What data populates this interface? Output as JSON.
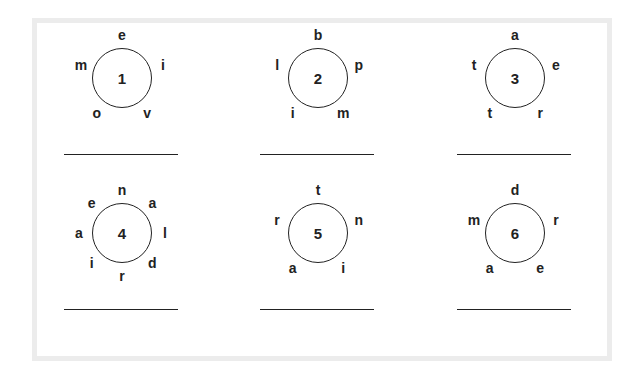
{
  "worksheet": {
    "puzzles": [
      {
        "number": "1",
        "letters": [
          "e",
          "i",
          "v",
          "o",
          "m"
        ]
      },
      {
        "number": "2",
        "letters": [
          "b",
          "p",
          "m",
          "i",
          "l"
        ]
      },
      {
        "number": "3",
        "letters": [
          "a",
          "e",
          "r",
          "t",
          "t"
        ]
      },
      {
        "number": "4",
        "letters": [
          "n",
          "a",
          "l",
          "d",
          "r",
          "i",
          "a",
          "e"
        ]
      },
      {
        "number": "5",
        "letters": [
          "t",
          "n",
          "i",
          "a",
          "r"
        ]
      },
      {
        "number": "6",
        "letters": [
          "d",
          "r",
          "e",
          "a",
          "m"
        ]
      }
    ],
    "answers": [
      "",
      "",
      "",
      "",
      "",
      ""
    ]
  }
}
